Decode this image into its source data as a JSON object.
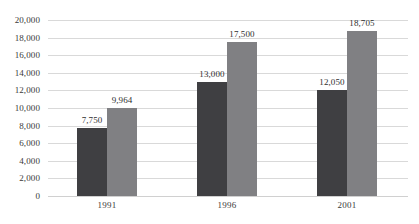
{
  "chart_data": {
    "type": "bar",
    "title": "",
    "subtitle": "",
    "xlabel": "",
    "ylabel": "",
    "categories": [
      "1991",
      "1996",
      "2001"
    ],
    "series": [
      {
        "name": "Series 1",
        "color": "#3f3f42",
        "values": [
          7750,
          13000,
          12050
        ],
        "labels": [
          "7,750",
          "13,000",
          "12,050"
        ]
      },
      {
        "name": "Series 2",
        "color": "#808083",
        "values": [
          9964,
          17500,
          18705
        ],
        "labels": [
          "9,964",
          "17,500",
          "18,705"
        ]
      }
    ],
    "ylim": [
      0,
      20000
    ],
    "ytick_step": 2000,
    "ytick_labels": [
      "20,000",
      "18,000",
      "16,000",
      "14,000",
      "12,000",
      "10,000",
      "8,000",
      "6,000",
      "4,000",
      "2,000",
      "0"
    ],
    "ytick_values": [
      20000,
      18000,
      16000,
      14000,
      12000,
      10000,
      8000,
      6000,
      4000,
      2000,
      0
    ],
    "grid": true,
    "grid_axis": "y",
    "legend": false,
    "legend_position": "none",
    "data_labels": true,
    "background_color": "#ffffff",
    "gridline_color": "#d9d9d9",
    "text_color": "#3a3a3a"
  }
}
